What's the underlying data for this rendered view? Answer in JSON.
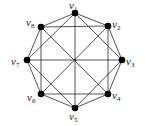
{
  "diagram": {
    "type": "graph",
    "nodes": [
      {
        "id": "v1",
        "base": "v",
        "sub": "1",
        "x": 75,
        "y": 13,
        "lx": 69,
        "ly": 0
      },
      {
        "id": "v2",
        "base": "v",
        "sub": "2",
        "x": 108,
        "y": 26,
        "lx": 112,
        "ly": 19
      },
      {
        "id": "v3",
        "base": "v",
        "sub": "3",
        "x": 122,
        "y": 60,
        "lx": 126,
        "ly": 56
      },
      {
        "id": "v4",
        "base": "v",
        "sub": "4",
        "x": 108,
        "y": 94,
        "lx": 112,
        "ly": 90
      },
      {
        "id": "v5",
        "base": "v",
        "sub": "5",
        "x": 75,
        "y": 108,
        "lx": 69,
        "ly": 111
      },
      {
        "id": "v6",
        "base": "v",
        "sub": "6",
        "x": 41,
        "y": 94,
        "lx": 27,
        "ly": 92
      },
      {
        "id": "v7",
        "base": "v",
        "sub": "7",
        "x": 27,
        "y": 60,
        "lx": 11,
        "ly": 56
      },
      {
        "id": "v8",
        "base": "v",
        "sub": "8",
        "x": 41,
        "y": 27,
        "lx": 26,
        "ly": 17
      }
    ],
    "edges": [
      [
        "v1",
        "v2"
      ],
      [
        "v2",
        "v3"
      ],
      [
        "v3",
        "v4"
      ],
      [
        "v4",
        "v5"
      ],
      [
        "v5",
        "v6"
      ],
      [
        "v6",
        "v7"
      ],
      [
        "v7",
        "v8"
      ],
      [
        "v8",
        "v1"
      ],
      [
        "v1",
        "v3"
      ],
      [
        "v3",
        "v5"
      ],
      [
        "v5",
        "v7"
      ],
      [
        "v7",
        "v1"
      ],
      [
        "v2",
        "v4"
      ],
      [
        "v4",
        "v6"
      ],
      [
        "v6",
        "v8"
      ],
      [
        "v8",
        "v2"
      ],
      [
        "v1",
        "v5"
      ],
      [
        "v2",
        "v6"
      ],
      [
        "v3",
        "v7"
      ],
      [
        "v4",
        "v8"
      ]
    ],
    "center": {
      "x": 75,
      "y": 60
    }
  }
}
